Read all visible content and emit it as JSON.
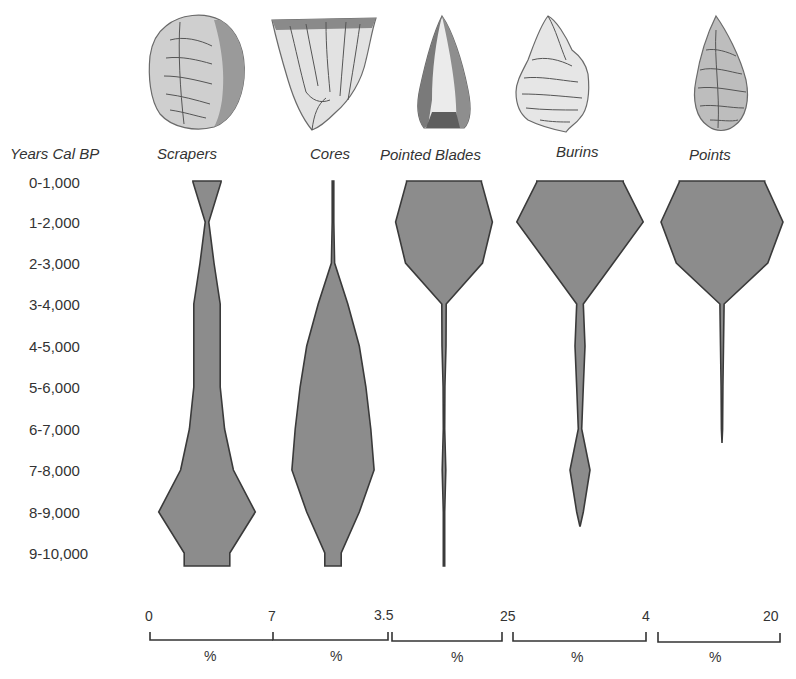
{
  "chart_data": {
    "type": "battleship",
    "title": "",
    "ylabel": "Years Cal BP",
    "xlabel": "%",
    "categories": [
      "0-1,000",
      "1-2,000",
      "2-3,000",
      "3-4,000",
      "4-5,000",
      "5-6,000",
      "6-7,000",
      "7-8,000",
      "8-9,000",
      "9-10,000"
    ],
    "series": [
      {
        "name": "Scrapers",
        "scale_max": 7,
        "scale_labels": [
          "0",
          "7"
        ],
        "values": [
          1.6,
          0.2,
          0.8,
          1.5,
          1.5,
          1.5,
          2.0,
          3.0,
          5.5,
          2.6
        ]
      },
      {
        "name": "Cores",
        "scale_max": 3.5,
        "scale_labels": [
          "3.5"
        ],
        "values": [
          0.05,
          0.05,
          0.1,
          0.9,
          1.6,
          2.0,
          2.3,
          2.5,
          1.6,
          0.5
        ]
      },
      {
        "name": "Pointed Blades",
        "scale_max": 25,
        "scale_labels": [
          "25"
        ],
        "values": [
          17.0,
          22.0,
          17.5,
          1.0,
          0.9,
          0.4,
          0.3,
          0.8,
          0.3,
          0.3
        ]
      },
      {
        "name": "Burins",
        "scale_max": 4,
        "scale_labels": [
          "4"
        ],
        "values": [
          2.6,
          3.8,
          2.0,
          0.2,
          0.3,
          0.2,
          0.1,
          0.6,
          0.2,
          0
        ]
      },
      {
        "name": "Points",
        "scale_max": 20,
        "scale_labels": [
          "20"
        ],
        "values": [
          14.0,
          20.0,
          15.0,
          0.7,
          0.5,
          0.3,
          0.1,
          0,
          0,
          0
        ]
      }
    ],
    "x_axis_unit_labels": [
      "%",
      "%",
      "%",
      "%",
      "%"
    ],
    "grid": false,
    "legend": "none (column headers with artifact illustrations)"
  },
  "labels": {
    "y_title": "Years Cal BP",
    "rows": [
      "0-1,000",
      "1-2,000",
      "2-3,000",
      "3-4,000",
      "4-5,000",
      "5-6,000",
      "6-7,000",
      "7-8,000",
      "8-9,000",
      "9-10,000"
    ],
    "columns": [
      "Scrapers",
      "Cores",
      "Pointed Blades",
      "Burins",
      "Points"
    ],
    "scale": {
      "ticks": [
        "0",
        "7",
        "3.5",
        "25",
        "4",
        "20"
      ],
      "units": [
        "%",
        "%",
        "%",
        "%",
        "%"
      ]
    }
  },
  "artifacts": [
    {
      "name": "scraper-illustration"
    },
    {
      "name": "core-illustration"
    },
    {
      "name": "pointed-blade-illustration"
    },
    {
      "name": "burin-illustration"
    },
    {
      "name": "point-illustration"
    }
  ],
  "colors": {
    "fill": "#8c8c8c",
    "stroke": "#3a3a3a",
    "text": "#333333",
    "background": "#ffffff"
  }
}
